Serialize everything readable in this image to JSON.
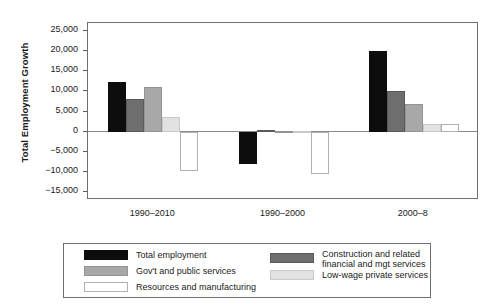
{
  "chart_data": {
    "type": "bar",
    "title": "",
    "subtitle": "",
    "xlabel": "",
    "ylabel": "Total Employment Growth",
    "categories": [
      "1990–2010",
      "1990–2000",
      "2000–8"
    ],
    "ylim": [
      -17000,
      27000
    ],
    "yticks": [
      25000,
      20000,
      15000,
      10000,
      5000,
      0,
      -5000,
      -10000,
      -15000
    ],
    "ytick_labels": [
      "25,000",
      "20,000",
      "15,000",
      "10,000",
      "5,000",
      "0",
      "−5,000",
      "−10,000",
      "−15,000"
    ],
    "grid": false,
    "legend_position": "bottom",
    "series": [
      {
        "name": "Total employment",
        "color": "#0d0d0d",
        "border": "#0d0d0d",
        "values": [
          12400,
          -8000,
          20100
        ]
      },
      {
        "name": "Construction and related financial and mgt services",
        "color": "#6e6e6e",
        "border": "#5a5a5a",
        "values": [
          8100,
          400,
          10000
        ]
      },
      {
        "name": "Gov't and public services",
        "color": "#a8a8a8",
        "border": "#949494",
        "values": [
          11000,
          250,
          6800
        ]
      },
      {
        "name": "Low-wage private services",
        "color": "#e2e2e2",
        "border": "#c9c9c9",
        "values": [
          3700,
          150,
          2000
        ]
      },
      {
        "name": "Resources and manufacturing",
        "color": "#ffffff",
        "border": "#b0b0b0",
        "values": [
          -9800,
          -10500,
          1900
        ]
      }
    ]
  },
  "legend": {
    "entries": [
      {
        "label": "Total employment",
        "label_line2": "",
        "swatch": "black-swatch"
      },
      {
        "label": "Construction and related",
        "label_line2": "financial and mgt services",
        "swatch": "dark-gray-swatch"
      },
      {
        "label": "Gov't and public services",
        "label_line2": "",
        "swatch": "mid-gray-swatch"
      },
      {
        "label": "Low-wage private services",
        "label_line2": "",
        "swatch": "light-gray-swatch"
      },
      {
        "label": "Resources and manufacturing",
        "label_line2": "",
        "swatch": "white-swatch"
      }
    ]
  }
}
